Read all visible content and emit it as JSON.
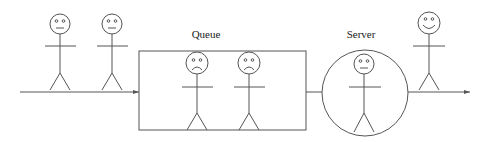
{
  "diagram": {
    "type": "queueing-system",
    "labels": {
      "queue": "Queue",
      "server": "Server"
    },
    "colors": {
      "line": "#555555",
      "text": "#222222",
      "background": "#ffffff"
    },
    "arrivals": [
      {
        "id": "waiting-outside-1",
        "mood": "neutral"
      },
      {
        "id": "waiting-outside-2",
        "mood": "neutral"
      }
    ],
    "queue": [
      {
        "id": "in-queue-1",
        "mood": "sad"
      },
      {
        "id": "in-queue-2",
        "mood": "sad"
      }
    ],
    "server": {
      "id": "being-served",
      "mood": "neutral"
    },
    "departures": [
      {
        "id": "departed",
        "mood": "happy"
      }
    ]
  }
}
